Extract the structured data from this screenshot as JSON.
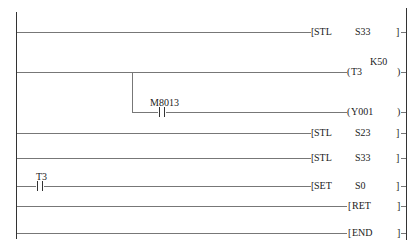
{
  "diagram": {
    "type": "ladder-logic",
    "rungs": [
      {
        "id": 1,
        "contact": null,
        "instruction": {
          "open": "[",
          "op": "STL",
          "operand": "S33",
          "close": "]"
        }
      },
      {
        "id": 2,
        "contact": null,
        "instruction": {
          "open": "(",
          "op": "T3",
          "operand": "",
          "setting": "K50",
          "close": ")"
        }
      },
      {
        "id": 3,
        "branch": true,
        "contact": {
          "label": "M8013",
          "type": "NO"
        },
        "instruction": {
          "open": "(",
          "op": "Y001",
          "operand": "",
          "close": ")"
        }
      },
      {
        "id": 4,
        "contact": null,
        "instruction": {
          "open": "[",
          "op": "STL",
          "operand": "S23",
          "close": "]"
        }
      },
      {
        "id": 5,
        "contact": null,
        "instruction": {
          "open": "[",
          "op": "STL",
          "operand": "S33",
          "close": "]"
        }
      },
      {
        "id": 6,
        "contact": {
          "label": "T3",
          "type": "NO"
        },
        "instruction": {
          "open": "[",
          "op": "SET",
          "operand": "S0",
          "close": "]"
        }
      },
      {
        "id": 7,
        "contact": null,
        "instruction": {
          "open": "[",
          "op": "RET",
          "operand": "",
          "close": "]"
        }
      },
      {
        "id": 8,
        "contact": null,
        "instruction": {
          "open": "[",
          "op": "END",
          "operand": "",
          "close": "]"
        }
      }
    ]
  }
}
